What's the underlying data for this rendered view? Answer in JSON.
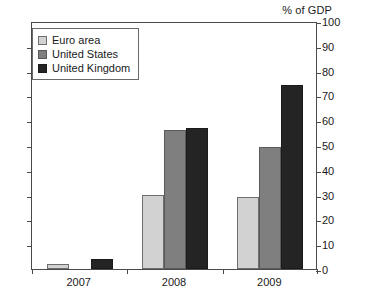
{
  "chart_data": {
    "type": "bar",
    "title": "% of GDP",
    "subtitle": "",
    "xlabel": "",
    "ylabel": "% of GDP",
    "categories": [
      "2007",
      "2008",
      "2009"
    ],
    "series": [
      {
        "name": "Euro area",
        "color": "#d2d2d2",
        "values": [
          2,
          30,
          29
        ]
      },
      {
        "name": "United States",
        "color": "#7f7f7f",
        "values": [
          0,
          56,
          49
        ]
      },
      {
        "name": "United Kingdom",
        "color": "#242424",
        "values": [
          4,
          57,
          74
        ]
      }
    ],
    "ylim": [
      0,
      100
    ],
    "ytick_step": 10,
    "ytick_labels": [
      "0",
      "10",
      "20",
      "30",
      "40",
      "50",
      "60",
      "70",
      "80",
      "90",
      "100"
    ],
    "yaxis_position": "right",
    "grid": false,
    "legend_position": "top-left"
  },
  "axis": {
    "title": "% of GDP"
  }
}
